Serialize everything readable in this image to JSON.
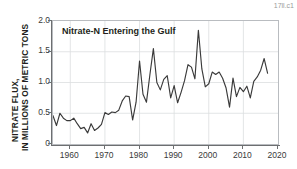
{
  "figure": {
    "corner_id": "17ll.c1"
  },
  "chart_data": {
    "type": "line",
    "title": "Nitrate-N Entering the Gulf",
    "xlabel": "",
    "ylabel": "NITRATE FLUX, IN MILLIONS OF METRIC TONS",
    "ylabel_line1": "NITRATE FLUX,",
    "ylabel_line2": "IN MILLIONS OF METRIC TONS",
    "xlim": [
      1955,
      2020
    ],
    "ylim": [
      0,
      2.0
    ],
    "xticks": [
      1960,
      1970,
      1980,
      1990,
      2000,
      2010,
      2020
    ],
    "xticklabels": [
      "1960",
      "1970",
      "1980",
      "1990",
      "2000",
      "2010",
      "2020"
    ],
    "yticks": [
      0,
      0.5,
      1.0,
      1.5,
      2.0
    ],
    "yticklabels": [
      "0",
      "0.5",
      "1.0",
      "1.5",
      "2.0"
    ],
    "grid": true,
    "legend": false,
    "line_color": "#3a3a3a",
    "grid_color": "#dcdee0",
    "series": [
      {
        "name": "Nitrate-N flux to the Gulf of Mexico",
        "units": "millions of metric tons",
        "x": [
          1955,
          1956,
          1957,
          1958,
          1959,
          1960,
          1961,
          1962,
          1963,
          1964,
          1965,
          1966,
          1967,
          1968,
          1969,
          1970,
          1971,
          1972,
          1973,
          1974,
          1975,
          1976,
          1977,
          1978,
          1979,
          1980,
          1981,
          1982,
          1983,
          1984,
          1985,
          1986,
          1987,
          1988,
          1989,
          1990,
          1991,
          1992,
          1993,
          1994,
          1995,
          1996,
          1997,
          1998,
          1999,
          2000,
          2001,
          2002,
          2003,
          2004,
          2005,
          2006,
          2007,
          2008,
          2009,
          2010,
          2011,
          2012,
          2013,
          2014,
          2015,
          2016,
          2017
        ],
        "values": [
          0.46,
          0.3,
          0.5,
          0.42,
          0.38,
          0.38,
          0.42,
          0.33,
          0.25,
          0.27,
          0.18,
          0.33,
          0.22,
          0.26,
          0.32,
          0.51,
          0.48,
          0.52,
          0.51,
          0.55,
          0.7,
          0.78,
          0.77,
          0.39,
          0.68,
          1.35,
          0.81,
          0.68,
          1.13,
          1.55,
          1.0,
          0.88,
          1.05,
          1.11,
          0.75,
          0.95,
          0.67,
          0.84,
          1.03,
          1.29,
          1.25,
          1.06,
          1.85,
          1.22,
          0.93,
          0.98,
          1.17,
          1.13,
          1.17,
          1.07,
          0.91,
          0.6,
          1.07,
          0.77,
          0.92,
          0.85,
          0.94,
          0.75,
          1.02,
          1.09,
          1.2,
          1.39,
          1.15
        ]
      }
    ]
  }
}
